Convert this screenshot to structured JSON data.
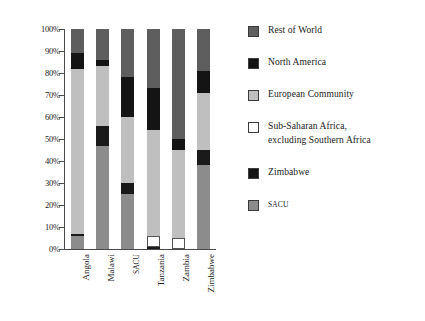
{
  "chart_data": {
    "type": "bar",
    "stacked": true,
    "title": "",
    "xlabel": "",
    "ylabel": "",
    "ylim": [
      0,
      100
    ],
    "ytick_labels": [
      "0%",
      "10%",
      "20%",
      "30%",
      "40%",
      "50%",
      "60%",
      "70%",
      "80%",
      "90%",
      "100%"
    ],
    "ytick_values": [
      0,
      10,
      20,
      30,
      40,
      50,
      60,
      70,
      80,
      90,
      100
    ],
    "grid": false,
    "legend_position": "right",
    "categories": [
      "Angola",
      "Malawi",
      "SACU",
      "Tanzania",
      "Zambia",
      "Zimbabwe"
    ],
    "stack_order_bottom_to_top": [
      "SACU",
      "Zimbabwe",
      "Sub-Saharan Africa, excluding Southern Africa",
      "European Community",
      "North America",
      "Rest of World"
    ],
    "series": [
      {
        "name": "SACU",
        "color": "#8c8c8c",
        "values": [
          6,
          47,
          25,
          0,
          0,
          38
        ]
      },
      {
        "name": "Zimbabwe",
        "color": "#1a1a1a",
        "values": [
          1,
          9,
          5,
          1,
          0,
          7
        ]
      },
      {
        "name": "Sub-Saharan Africa, excluding Southern Africa",
        "color": "#ffffff",
        "values": [
          0,
          0,
          0,
          5,
          5,
          0
        ]
      },
      {
        "name": "European Community",
        "color": "#bfbfbf",
        "values": [
          75,
          27,
          30,
          48,
          40,
          26
        ]
      },
      {
        "name": "North America",
        "color": "#141414",
        "values": [
          7,
          3,
          18,
          19,
          5,
          10
        ]
      },
      {
        "name": "Rest of World",
        "color": "#5e5e5e",
        "values": [
          11,
          14,
          22,
          27,
          50,
          19
        ]
      }
    ]
  },
  "legend": {
    "items": [
      {
        "label": "Rest of World",
        "color": "#5e5e5e",
        "small": false
      },
      {
        "label": "North America",
        "color": "#141414",
        "small": false
      },
      {
        "label": "European Community",
        "color": "#bfbfbf",
        "small": false
      },
      {
        "label": "Sub-Saharan Africa,",
        "label2": "excluding Southern Africa",
        "color": "#ffffff",
        "small": false
      },
      {
        "label": "Zimbabwe",
        "color": "#141414",
        "small": false
      },
      {
        "label": "SACU",
        "color": "#8c8c8c",
        "small": true
      }
    ]
  },
  "colors": {
    "axis": "#4a4a4a",
    "background": "#ffffff",
    "text": "#1a1a1a"
  }
}
